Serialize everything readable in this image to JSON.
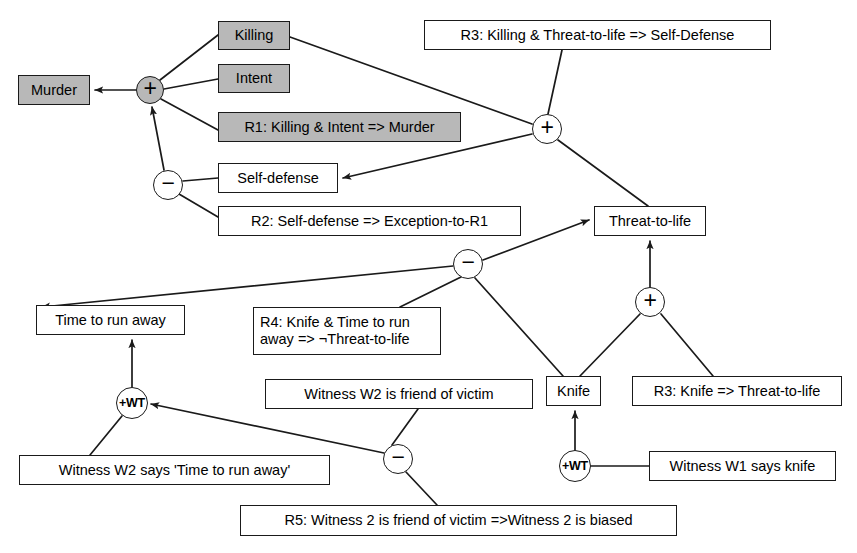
{
  "diagram": {
    "background": "#ffffff",
    "line_color": "#1a1a1a",
    "shaded_fill": "#b8b8b8",
    "nodes": [
      {
        "id": "murder",
        "label": "Murder",
        "shaded": true,
        "x": 18,
        "y": 75,
        "w": 72,
        "h": 30
      },
      {
        "id": "killing",
        "label": "Killing",
        "shaded": true,
        "x": 218,
        "y": 21,
        "w": 72,
        "h": 29
      },
      {
        "id": "intent",
        "label": "Intent",
        "shaded": true,
        "x": 218,
        "y": 64,
        "w": 72,
        "h": 29
      },
      {
        "id": "r1",
        "label": "R1: Killing & Intent => Murder",
        "shaded": true,
        "x": 218,
        "y": 112,
        "w": 243,
        "h": 30
      },
      {
        "id": "selfdefense",
        "label": "Self-defense",
        "shaded": false,
        "x": 218,
        "y": 163,
        "w": 120,
        "h": 30
      },
      {
        "id": "r2",
        "label": "R2: Self-defense => Exception-to-R1",
        "shaded": false,
        "x": 218,
        "y": 206,
        "w": 303,
        "h": 30
      },
      {
        "id": "r3sd",
        "label": "R3: Killing & Threat-to-life => Self-Defense",
        "shaded": false,
        "x": 424,
        "y": 20,
        "w": 347,
        "h": 30
      },
      {
        "id": "threat",
        "label": "Threat-to-life",
        "shaded": false,
        "x": 594,
        "y": 206,
        "w": 112,
        "h": 30
      },
      {
        "id": "timetorun",
        "label": "Time to run away",
        "shaded": false,
        "x": 36,
        "y": 305,
        "w": 149,
        "h": 30
      },
      {
        "id": "r4",
        "label": "R4: Knife & Time to run\naway => ¬Threat-to-life",
        "shaded": false,
        "x": 253,
        "y": 307,
        "w": 188,
        "h": 48
      },
      {
        "id": "w2friend",
        "label": "Witness W2 is friend of victim",
        "shaded": false,
        "x": 265,
        "y": 379,
        "w": 268,
        "h": 30
      },
      {
        "id": "knife",
        "label": "Knife",
        "shaded": false,
        "x": 546,
        "y": 376,
        "w": 55,
        "h": 30
      },
      {
        "id": "r3knife",
        "label": "R3: Knife => Threat-to-life",
        "shaded": false,
        "x": 632,
        "y": 376,
        "w": 210,
        "h": 30
      },
      {
        "id": "w2says",
        "label": "Witness W2 says 'Time to run away'",
        "shaded": false,
        "x": 19,
        "y": 455,
        "w": 311,
        "h": 30
      },
      {
        "id": "w1says",
        "label": "Witness W1 says knife",
        "shaded": false,
        "x": 649,
        "y": 451,
        "w": 187,
        "h": 30
      },
      {
        "id": "r5",
        "label": "R5: Witness 2 is friend of victim =>Witness 2 is biased",
        "shaded": false,
        "x": 240,
        "y": 505,
        "w": 437,
        "h": 31
      }
    ],
    "connectors": [
      {
        "id": "plus-murder",
        "symbol": "+",
        "kind": "op",
        "shaded": true,
        "cx": 150,
        "cy": 90,
        "r": 14
      },
      {
        "id": "minus-r1",
        "symbol": "−",
        "kind": "op",
        "shaded": false,
        "cx": 168,
        "cy": 185,
        "r": 15
      },
      {
        "id": "plus-selfdef",
        "symbol": "+",
        "kind": "op",
        "shaded": false,
        "cx": 547,
        "cy": 129,
        "r": 15
      },
      {
        "id": "minus-threat",
        "symbol": "−",
        "kind": "op",
        "shaded": false,
        "cx": 468,
        "cy": 264,
        "r": 15
      },
      {
        "id": "plus-threat",
        "symbol": "+",
        "kind": "op",
        "shaded": false,
        "cx": 650,
        "cy": 302,
        "r": 15
      },
      {
        "id": "wt-timetorun",
        "symbol": "+WT",
        "kind": "wt",
        "shaded": false,
        "cx": 132,
        "cy": 403,
        "r": 16
      },
      {
        "id": "minus-bias",
        "symbol": "−",
        "kind": "op",
        "shaded": false,
        "cx": 398,
        "cy": 459,
        "r": 15
      },
      {
        "id": "wt-knife",
        "symbol": "+WT",
        "kind": "wt",
        "shaded": false,
        "cx": 575,
        "cy": 466,
        "r": 16
      }
    ],
    "edges": [
      {
        "id": "e-plus-murder",
        "from": "plus-murder",
        "to": "murder",
        "arrow": true,
        "points": [
          [
            136,
            90
          ],
          [
            95,
            90
          ]
        ]
      },
      {
        "id": "e-killing-plus",
        "from": "killing",
        "to": "plus-murder",
        "arrow": false,
        "points": [
          [
            218,
            35
          ],
          [
            160,
            80
          ]
        ]
      },
      {
        "id": "e-intent-plus",
        "from": "intent",
        "to": "plus-murder",
        "arrow": false,
        "points": [
          [
            218,
            79
          ],
          [
            164,
            89
          ]
        ]
      },
      {
        "id": "e-r1-plus",
        "from": "r1",
        "to": "plus-murder",
        "arrow": false,
        "points": [
          [
            218,
            130
          ],
          [
            161,
            99
          ]
        ]
      },
      {
        "id": "e-minus-plus",
        "from": "minus-r1",
        "to": "plus-murder",
        "arrow": true,
        "points": [
          [
            164,
            170
          ],
          [
            152,
            107
          ]
        ]
      },
      {
        "id": "e-sd-minus",
        "from": "selfdefense",
        "to": "minus-r1",
        "arrow": false,
        "points": [
          [
            218,
            178
          ],
          [
            183,
            181
          ]
        ]
      },
      {
        "id": "e-r2-minus",
        "from": "r2",
        "to": "minus-r1",
        "arrow": false,
        "points": [
          [
            218,
            217
          ],
          [
            179,
            194
          ]
        ]
      },
      {
        "id": "e-r3sd-plus",
        "from": "r3sd",
        "to": "plus-selfdef",
        "arrow": false,
        "points": [
          [
            562,
            50
          ],
          [
            548,
            114
          ]
        ]
      },
      {
        "id": "e-killing-plus2",
        "from": "killing",
        "to": "plus-selfdef",
        "arrow": false,
        "points": [
          [
            290,
            37
          ],
          [
            532,
            124
          ]
        ]
      },
      {
        "id": "e-plus-sd",
        "from": "plus-selfdef",
        "to": "selfdefense",
        "arrow": true,
        "points": [
          [
            532,
            134
          ],
          [
            343,
            178
          ]
        ]
      },
      {
        "id": "e-threat-plus",
        "from": "threat",
        "to": "plus-selfdef",
        "arrow": false,
        "points": [
          [
            648,
            206
          ],
          [
            558,
            140
          ]
        ]
      },
      {
        "id": "e-minus-threat",
        "from": "minus-threat",
        "to": "threat",
        "arrow": true,
        "points": [
          [
            483,
            260
          ],
          [
            589,
            220
          ]
        ]
      },
      {
        "id": "e-ttr-minus",
        "from": "timetorun",
        "to": "minus-threat",
        "arrow": true,
        "points": [
          [
            453,
            266
          ],
          [
            42,
            307
          ]
        ]
      },
      {
        "id": "e-r4-minus",
        "from": "r4",
        "to": "minus-threat",
        "arrow": false,
        "points": [
          [
            400,
            307
          ],
          [
            461,
            277
          ]
        ]
      },
      {
        "id": "e-knife-minus",
        "from": "knife",
        "to": "minus-threat",
        "arrow": false,
        "points": [
          [
            563,
            376
          ],
          [
            475,
            278
          ]
        ]
      },
      {
        "id": "e-plus-threatup",
        "from": "plus-threat",
        "to": "threat",
        "arrow": true,
        "points": [
          [
            650,
            287
          ],
          [
            650,
            241
          ]
        ]
      },
      {
        "id": "e-knife-plus",
        "from": "knife",
        "to": "plus-threat",
        "arrow": false,
        "points": [
          [
            580,
            376
          ],
          [
            640,
            314
          ]
        ]
      },
      {
        "id": "e-r3k-plus",
        "from": "r3knife",
        "to": "plus-threat",
        "arrow": false,
        "points": [
          [
            713,
            376
          ],
          [
            661,
            314
          ]
        ]
      },
      {
        "id": "e-wt-ttr",
        "from": "wt-timetorun",
        "to": "timetorun",
        "arrow": true,
        "points": [
          [
            132,
            387
          ],
          [
            132,
            340
          ]
        ]
      },
      {
        "id": "e-w2says-wt",
        "from": "w2says",
        "to": "wt-timetorun",
        "arrow": false,
        "points": [
          [
            90,
            455
          ],
          [
            122,
            416
          ]
        ]
      },
      {
        "id": "e-minusb-wt",
        "from": "minus-bias",
        "to": "wt-timetorun",
        "arrow": true,
        "points": [
          [
            384,
            453
          ],
          [
            151,
            404
          ]
        ]
      },
      {
        "id": "e-w2f-minusb",
        "from": "w2friend",
        "to": "minus-bias",
        "arrow": false,
        "points": [
          [
            418,
            409
          ],
          [
            392,
            445
          ]
        ]
      },
      {
        "id": "e-r5-minusb",
        "from": "r5",
        "to": "minus-bias",
        "arrow": false,
        "points": [
          [
            437,
            505
          ],
          [
            406,
            472
          ]
        ]
      },
      {
        "id": "e-wtk-knife",
        "from": "wt-knife",
        "to": "knife",
        "arrow": true,
        "points": [
          [
            575,
            450
          ],
          [
            575,
            411
          ]
        ]
      },
      {
        "id": "e-w1says-wtk",
        "from": "w1says",
        "to": "wt-knife",
        "arrow": false,
        "points": [
          [
            649,
            466
          ],
          [
            591,
            466
          ]
        ]
      }
    ]
  }
}
